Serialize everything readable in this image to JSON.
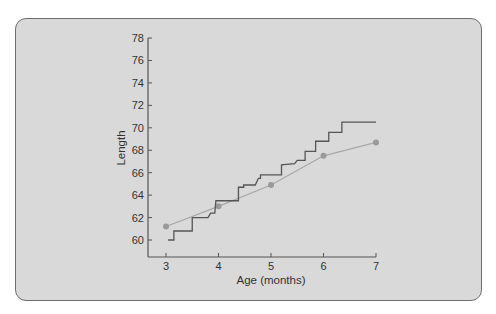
{
  "chart_data": {
    "type": "line",
    "title": "",
    "xlabel": "Age (months)",
    "ylabel": "Length",
    "xlim": [
      3,
      7
    ],
    "ylim": [
      58.5,
      78
    ],
    "x_ticks": [
      "3",
      "4",
      "5",
      "6",
      "7"
    ],
    "y_ticks": [
      "60",
      "62",
      "64",
      "66",
      "68",
      "70",
      "72",
      "74",
      "76",
      "78"
    ],
    "grid": false,
    "legend": null,
    "series": [
      {
        "name": "Measured length (step)",
        "style": "step",
        "color": "#555555",
        "points": [
          [
            3.04,
            60.0
          ],
          [
            3.15,
            60.0
          ],
          [
            3.15,
            60.8
          ],
          [
            3.5,
            60.8
          ],
          [
            3.5,
            62.0
          ],
          [
            3.8,
            62.0
          ],
          [
            3.85,
            62.4
          ],
          [
            3.93,
            62.4
          ],
          [
            3.95,
            63.5
          ],
          [
            4.38,
            63.5
          ],
          [
            4.38,
            64.7
          ],
          [
            4.48,
            64.7
          ],
          [
            4.48,
            64.9
          ],
          [
            4.7,
            64.9
          ],
          [
            4.76,
            65.5
          ],
          [
            4.8,
            65.5
          ],
          [
            4.8,
            65.8
          ],
          [
            5.2,
            65.8
          ],
          [
            5.2,
            66.7
          ],
          [
            5.45,
            66.8
          ],
          [
            5.5,
            67.1
          ],
          [
            5.65,
            67.1
          ],
          [
            5.65,
            67.9
          ],
          [
            5.85,
            67.9
          ],
          [
            5.85,
            68.8
          ],
          [
            6.1,
            68.8
          ],
          [
            6.1,
            69.6
          ],
          [
            6.35,
            69.6
          ],
          [
            6.35,
            70.5
          ],
          [
            7.0,
            70.5
          ]
        ]
      },
      {
        "name": "Average length",
        "style": "line-with-markers",
        "color": "#9a9a9a",
        "x": [
          3,
          4,
          5,
          6,
          7
        ],
        "values": [
          61.2,
          63.0,
          64.9,
          67.5,
          68.7
        ]
      }
    ]
  },
  "axes": {
    "x_label": "Age (months)",
    "y_label": "Length",
    "x_tick_labels": [
      "3",
      "4",
      "5",
      "6",
      "7"
    ],
    "y_tick_labels": [
      "60",
      "62",
      "64",
      "66",
      "68",
      "70",
      "72",
      "74",
      "76",
      "78"
    ]
  },
  "colors": {
    "card_bg": "#d9d9d9",
    "card_border": "#6e6e6e",
    "axis": "#555555",
    "step_line": "#555555",
    "avg_line": "#a8a8a8",
    "avg_marker": "#9a9a9a"
  }
}
